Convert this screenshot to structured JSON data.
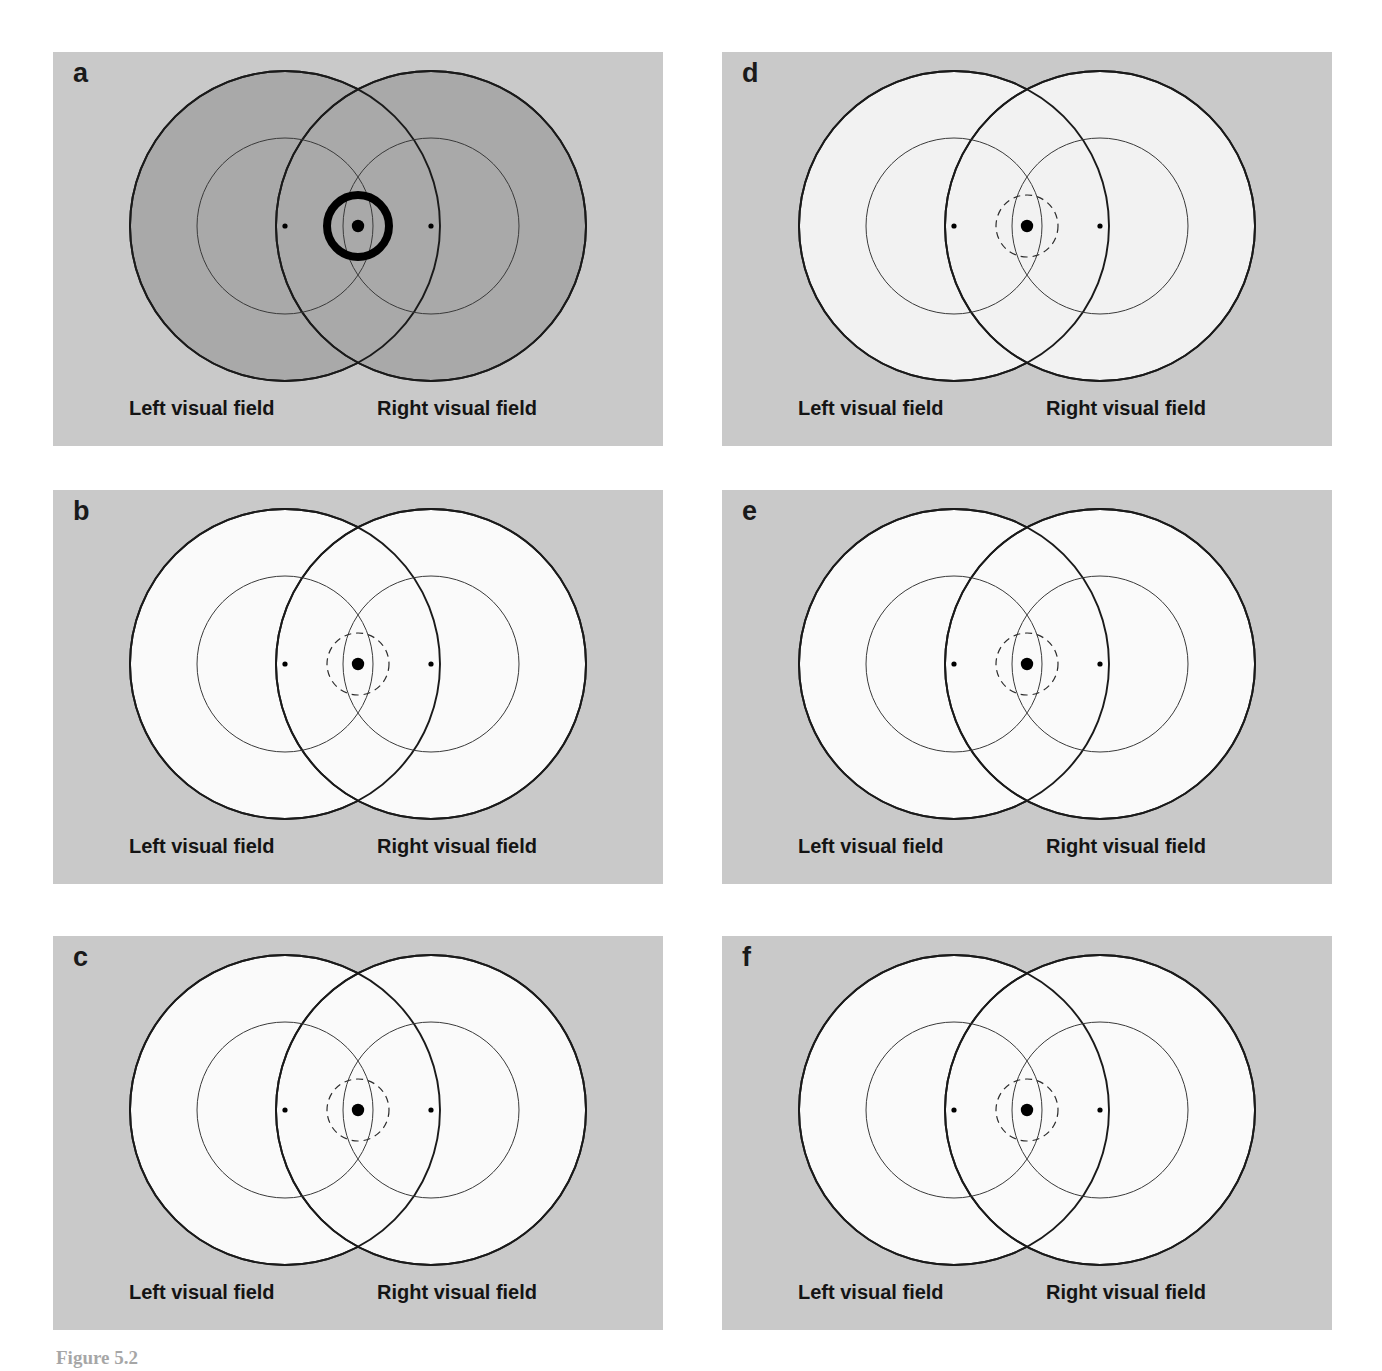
{
  "figure": {
    "caption_partial": "Figure 5.2",
    "panel_count": 6,
    "columns": 2,
    "rows": 3,
    "background_color": "#ffffff",
    "panel_background_color": "#c9c9c9"
  },
  "labels": {
    "left_visual_field": "Left visual field",
    "right_visual_field": "Right visual field"
  },
  "colors": {
    "panel_bg": "#c9c9c9",
    "circle_fill_white": "#fafafa",
    "circle_fill_gray": "#a9a9a9",
    "dark_gray": "#6e6e6e",
    "mid_gray": "#808080",
    "light_gray": "#d2d2d2",
    "outline": "#1a1a1a",
    "thin_outline": "#3a3a3a",
    "fixation": "#000000"
  },
  "geometry": {
    "panel_width": 610,
    "panel_height": 394,
    "col_x": [
      53,
      722
    ],
    "row_y": [
      52,
      490,
      936
    ],
    "left_circle_cx": 232,
    "right_circle_cx": 378,
    "circle_cy": 174,
    "outer_r": 155,
    "inner_r": 88,
    "center_r": 31,
    "fixation_cx": 305
  },
  "panels": [
    {
      "id": "a",
      "letter": "a",
      "content_name": "scribble-zigzag-texture",
      "circle_fill": "#a9a9a9",
      "has_thick_center_ring": true,
      "center_ring_style": "solid-thick-black",
      "description": "Two overlapping gray discs filled with tangled zigzag and wavy ink lines; a heavy black ring marks the central fixation zone.",
      "left_label": "Left visual field",
      "right_label": "Right visual field"
    },
    {
      "id": "b",
      "letter": "b",
      "content_name": "sparse-star-ring-texture",
      "circle_fill": "#fafafa",
      "has_thick_center_ring": false,
      "center_ring_style": "dashed",
      "has_dark_crescent": true,
      "crescent_color": "#6e6e6e",
      "description": "White discs with light gray six-point stars arranged in rings of constant angular spacing; a dark gray crescent occupies the far right edge of the right disc.",
      "left_label": "Left visual field",
      "right_label": "Right visual field"
    },
    {
      "id": "c",
      "letter": "c",
      "content_name": "size-scaled-star-texture",
      "circle_fill": "#fafafa",
      "has_thick_center_ring": false,
      "center_ring_style": "dashed",
      "description": "White discs filled with gray stars whose size grows with eccentricity: small four-point sparkles near fixation, large eight-point stars in the periphery.",
      "left_label": "Left visual field",
      "right_label": "Right visual field"
    },
    {
      "id": "d",
      "letter": "d",
      "content_name": "natural-scene-face-and-hand",
      "circle_fill": "#f2f2f2",
      "has_thick_center_ring": false,
      "center_ring_style": "dashed",
      "description": "Two discs showing a posterized natural scene — a face with eyes on the left and an outstretched hand on the right — in dark gray, white and hatched light gray regions.",
      "left_label": "Left visual field",
      "right_label": "Right visual field"
    },
    {
      "id": "e",
      "letter": "e",
      "content_name": "uniform-dot-texture",
      "circle_fill": "#fafafa",
      "has_thick_center_ring": false,
      "center_ring_style": "dashed",
      "dot_color": "#808080",
      "description": "White discs covered by an evenly spaced jittered field of medium gray dots of uniform size.",
      "left_label": "Left visual field",
      "right_label": "Right visual field"
    },
    {
      "id": "f",
      "letter": "f",
      "content_name": "dense-flower-rosette-texture",
      "circle_fill": "#fafafa",
      "has_thick_center_ring": false,
      "center_ring_style": "dashed",
      "description": "White discs densely packed with six-petal rosette shapes whose centers and petals vary from light to dark gray.",
      "left_label": "Left visual field",
      "right_label": "Right visual field"
    }
  ]
}
